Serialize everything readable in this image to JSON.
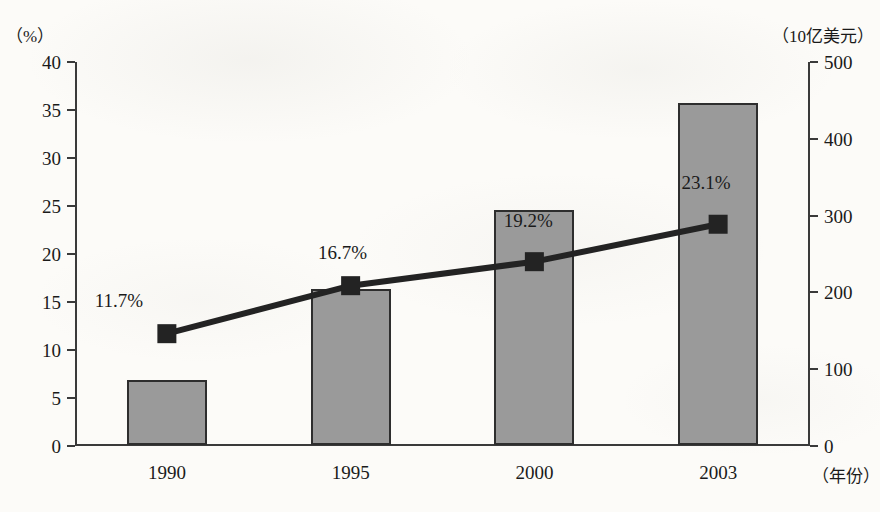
{
  "chart_data": {
    "type": "bar",
    "title": "",
    "subtitle": "",
    "xlabel": "（年份）",
    "categories": [
      "1990",
      "1995",
      "2000",
      "2003"
    ],
    "grid": false,
    "legend_position": "none",
    "axes": {
      "left": {
        "label": "（%）",
        "ylim": [
          0,
          40
        ],
        "tick_step": 5,
        "ticks": [
          "0",
          "5",
          "10",
          "15",
          "20",
          "25",
          "30",
          "35",
          "40"
        ]
      },
      "right": {
        "label": "（10亿美元）",
        "ylim": [
          0,
          500
        ],
        "tick_step": 100,
        "ticks": [
          "0",
          "100",
          "200",
          "300",
          "400",
          "500"
        ]
      }
    },
    "series": [
      {
        "name": "金额",
        "type": "bar",
        "axis": "right",
        "unit": "10亿美元",
        "values": [
          85,
          203,
          306,
          445
        ],
        "color": "#9a9a9a",
        "border_color": "#2e2e2e"
      },
      {
        "name": "比重",
        "type": "line",
        "axis": "left",
        "unit": "%",
        "values": [
          11.7,
          16.7,
          19.2,
          23.1
        ],
        "color": "#232323",
        "marker": "square",
        "data_labels": [
          "11.7%",
          "16.7%",
          "19.2%",
          "23.1%"
        ]
      }
    ],
    "annotations": [
      {
        "text": "11.7%",
        "category": "1990",
        "placement": "above-left-of-marker"
      },
      {
        "text": "16.7%",
        "category": "1995",
        "placement": "above-marker"
      },
      {
        "text": "19.2%",
        "category": "2000",
        "placement": "inside-bar"
      },
      {
        "text": "23.1%",
        "category": "2003",
        "placement": "inside-bar"
      }
    ]
  },
  "colors": {
    "background": "#fcfbf8",
    "axis": "#3a3a3a",
    "bar_fill": "#9a9a9a",
    "bar_border": "#2e2e2e",
    "line": "#232323",
    "text": "#1a1a1a"
  }
}
